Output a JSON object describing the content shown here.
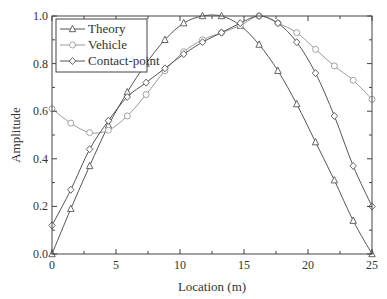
{
  "chart_data": {
    "type": "line",
    "title": "",
    "xlabel": "Location (m)",
    "ylabel": "Amplitude",
    "xlim": [
      0,
      25
    ],
    "ylim": [
      0.0,
      1.0
    ],
    "grid": false,
    "legend_position": "upper left",
    "xticks": [
      0,
      5,
      10,
      15,
      20,
      25
    ],
    "xtick_labels": [
      "0",
      "5",
      "10",
      "15",
      "20",
      "25"
    ],
    "yticks": [
      0.0,
      0.2,
      0.4,
      0.6,
      0.8,
      1.0
    ],
    "ytick_labels": [
      "0.0",
      "0.2",
      "0.4",
      "0.6",
      "0.8",
      "1.0"
    ],
    "x": [
      0,
      1.47,
      2.94,
      4.41,
      5.88,
      7.35,
      8.82,
      10.29,
      11.76,
      13.24,
      14.71,
      16.18,
      17.65,
      19.12,
      20.59,
      22.06,
      23.53,
      25
    ],
    "series": [
      {
        "name": "Theory",
        "marker": "triangle",
        "color": "#555555",
        "values": [
          0.0,
          0.19,
          0.37,
          0.54,
          0.68,
          0.8,
          0.9,
          0.97,
          1.0,
          1.0,
          0.96,
          0.88,
          0.77,
          0.63,
          0.47,
          0.31,
          0.14,
          0.0
        ]
      },
      {
        "name": "Vehicle",
        "marker": "circle",
        "color": "#999999",
        "values": [
          0.61,
          0.55,
          0.51,
          0.52,
          0.58,
          0.67,
          0.77,
          0.85,
          0.9,
          0.93,
          0.96,
          1.0,
          0.97,
          0.93,
          0.86,
          0.79,
          0.73,
          0.65
        ]
      },
      {
        "name": "Contact-point",
        "marker": "diamond",
        "color": "#555555",
        "values": [
          0.12,
          0.27,
          0.44,
          0.56,
          0.66,
          0.72,
          0.78,
          0.84,
          0.89,
          0.93,
          0.97,
          1.0,
          0.97,
          0.89,
          0.76,
          0.58,
          0.37,
          0.2
        ]
      }
    ]
  },
  "legend": {
    "items": [
      {
        "label": "Theory",
        "marker": "triangle"
      },
      {
        "label": "Vehicle",
        "marker": "circle"
      },
      {
        "label": "Contact-point",
        "marker": "diamond"
      }
    ]
  }
}
